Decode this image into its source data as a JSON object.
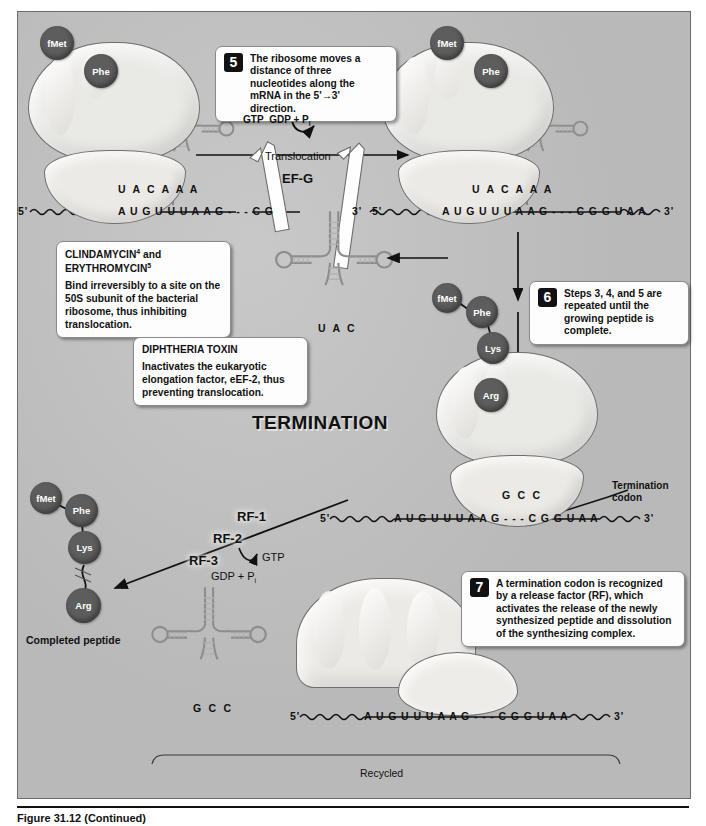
{
  "figure": {
    "title": "TERMINATION",
    "caption": "Figure 31.12 (Continued)"
  },
  "steps": [
    {
      "number": "5",
      "text": "The ribosome moves a distance of three nucleotides along the mRNA in the 5'→3' direction."
    },
    {
      "number": "6",
      "text": "Steps 3, 4, and 5 are repeated until the growing peptide is complete."
    },
    {
      "number": "7",
      "text": "A termination codon is recognized by a release factor (RF), which activates the release of the newly synthesized peptide and dissolution of the synthesizing complex."
    }
  ],
  "drug_callouts": [
    {
      "heading_parts": [
        "CLINDAMYCIN",
        "4",
        " and ",
        "ERYTHROMYCIN",
        "5"
      ],
      "heading_line1_name": "CLINDAMYCIN",
      "heading_line1_sup": "4",
      "heading_line1_tail": " and",
      "heading_line2_name": "ERYTHROMYCIN",
      "heading_line2_sup": "5",
      "body": "Bind irreversibly to a site on the 50S subunit of the bacterial ribosome, thus inhibiting translocation."
    },
    {
      "heading": "DIPHTHERIA TOXIN",
      "body": "Inactivates the eukaryotic elongation factor, eEF-2, thus preventing translocation."
    }
  ],
  "reaction": {
    "gtp": "GTP",
    "gdp_pi": "GDP + P",
    "gdp_pi_sub": "i",
    "process_label": "Translocation",
    "factor": "EF-G"
  },
  "release_factors": {
    "rf1": "RF-1",
    "rf2": "RF-2",
    "rf3": "RF-3",
    "gtp": "GTP",
    "gdp_pi": "GDP + P",
    "gdp_pi_sub": "i"
  },
  "labels": {
    "termination_codon": "Termination codon",
    "termination_codon_line1": "Termination",
    "termination_codon_line2": "codon",
    "completed_peptide": "Completed peptide",
    "recycled": "Recycled"
  },
  "amino_acids": {
    "fmet": "fMet",
    "phe": "Phe",
    "lys": "Lys",
    "arg": "Arg"
  },
  "mrna": {
    "five_prime": "5'",
    "three_prime": "3'",
    "left_panel_sequence": "A U G  U U U  A A G - - -  C        G",
    "right_panel_sequence": "A U G  U U U  A A G - - -  C G G  U A A",
    "termination_panel_sequence": "A U G  U U U  A A G - - -  C G G  U A A",
    "bottom_sequence": "A U G  U U U  A A G - - -  C G G  U A A"
  },
  "anticodons": {
    "left_ribosome": "U A C   A A A",
    "right_ribosome": "U A C   A A A",
    "free_trna_middle": "U A C",
    "termination_ribosome": "G C C",
    "free_trna_bottom": "G C C"
  },
  "colors": {
    "panel_background": "#b9b9b9",
    "ribosome_fill": "#e9e9e6",
    "amino_acid_fill": "#5d5d5d",
    "trna_stroke": "#8c8c8c",
    "callout_background": "#fdfdfd",
    "ink": "#111111"
  }
}
